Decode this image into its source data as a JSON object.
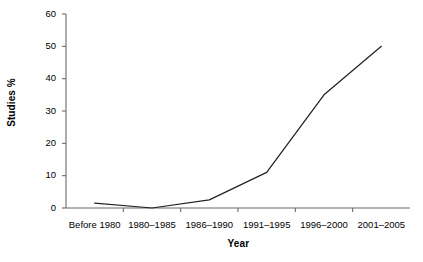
{
  "chart_data": {
    "type": "line",
    "title": "",
    "xlabel": "Year",
    "ylabel": "Studies %",
    "categories": [
      "Before 1980",
      "1980–1985",
      "1986–1990",
      "1991–1995",
      "1996–2000",
      "2001–2005"
    ],
    "values": [
      1.5,
      0,
      2.5,
      11,
      35,
      50
    ],
    "series": [
      {
        "name": "Studies %",
        "values": [
          1.5,
          0,
          2.5,
          11,
          35,
          50
        ]
      }
    ],
    "ylim": [
      0,
      60
    ],
    "yticks": [
      0,
      10,
      20,
      30,
      40,
      50,
      60
    ],
    "ytick_labels": [
      "0",
      "10",
      "20",
      "30",
      "40",
      "50",
      "60"
    ],
    "grid": false,
    "legend": false,
    "line_color": "#222222",
    "axis_color": "#6b6b6b",
    "background": "#ffffff",
    "markers": false
  },
  "axes": {
    "y_title": "Studies %",
    "x_title": "Year"
  }
}
